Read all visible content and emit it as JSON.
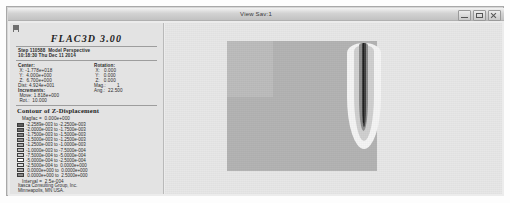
{
  "window": {
    "title": "View Sav:1",
    "buttons": [
      "minimize",
      "maximize",
      "close"
    ]
  },
  "legend": {
    "product_title": "FLAC3D 3.00",
    "step_line": "Step 110588  Model Perspective",
    "time_line": "10:18:30 Thu Dec 11 2014",
    "center": {
      "heading": "Center:",
      "x": " X: -1.778e+018",
      "y": " Y:  4.000e+000",
      "z": " Z:  6.700e+000",
      "dist": "Dist: 4.924e+001"
    },
    "rotation": {
      "heading": "Rotation:",
      "x": " X:   0.000",
      "y": " Y:   0.000",
      "z": " Z:   0.000",
      "mag": "Mag.:        1",
      "ang": "Ang.:  22.500"
    },
    "increments": {
      "heading": "Increments:",
      "move": " Move: 1.818e+000",
      "rot": " Rot.:  10.000"
    },
    "contour": {
      "title": "Contour of Z-Displacement",
      "magfac": "Magfac =  0.000e+000",
      "interval": "Interval =  2.5e-004",
      "entries": [
        {
          "color": "#5d5d5d",
          "label": "-2.2589e-003 to -2.2500e-003"
        },
        {
          "color": "#6e6e6e",
          "label": "-2.0000e-003 to -1.7500e-003"
        },
        {
          "color": "#838383",
          "label": "-1.7500e-003 to -1.5000e-003"
        },
        {
          "color": "#949494",
          "label": "-1.5000e-003 to -1.2500e-003"
        },
        {
          "color": "#a6a6a6",
          "label": "-1.2500e-003 to -1.0000e-003"
        },
        {
          "color": "#b8b8b8",
          "label": "-1.0000e-003 to -7.5000e-004"
        },
        {
          "color": "#cbcbcb",
          "label": "-7.5000e-004 to -5.0000e-004"
        },
        {
          "color": "#ffffff",
          "label": "-5.0000e-004 to -2.5000e-004"
        },
        {
          "color": "#dedede",
          "label": "-2.5000e-004 to  0.0000e+000"
        },
        {
          "color": "#b0b0b0",
          "label": " 0.0000e+000 to  0.0000e+000"
        },
        {
          "color": "#8a8a8a",
          "label": " 0.0000e+000 to  2.5000e+000"
        }
      ]
    },
    "footer": {
      "line1": "Itasca Consulting Group, Inc.",
      "line2": "Minneapolis, MN USA."
    }
  },
  "viewport": {
    "name": "model-plot",
    "colors": {
      "background": "#e7e7e7",
      "block": "#b3b3b3",
      "plume_halo": "#f4f4f4",
      "plume_core": "#1d1d1d"
    }
  }
}
